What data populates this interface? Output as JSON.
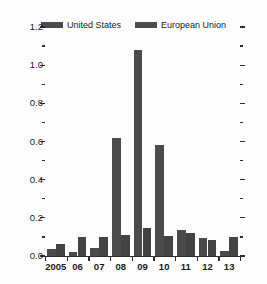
{
  "chart_data": {
    "type": "bar",
    "title": "",
    "subtitle": "",
    "xlabel": "",
    "ylabel": "",
    "ylim": [
      0.0,
      1.2
    ],
    "ytick_values": [
      0.0,
      0.2,
      0.4,
      0.6,
      0.8,
      1.0,
      1.2
    ],
    "ytick_labels": [
      "0.0",
      "0.2",
      "0.4",
      "0.6",
      "0.8",
      "1.0",
      "1.2"
    ],
    "yminor_values": [
      0.1,
      0.3,
      0.5,
      0.7,
      0.9,
      1.1
    ],
    "grid": false,
    "legend_position": "top-center",
    "categories": [
      "2005",
      "06",
      "07",
      "08",
      "09",
      "10",
      "11",
      "12",
      "13"
    ],
    "series": [
      {
        "name": "United States",
        "color": "#4b4b4b",
        "values": [
          0.035,
          0.02,
          0.04,
          0.62,
          1.08,
          0.58,
          0.135,
          0.095,
          0.025
        ]
      },
      {
        "name": "European Union",
        "color": "#434343",
        "values": [
          0.065,
          0.1,
          0.1,
          0.11,
          0.145,
          0.105,
          0.12,
          0.085,
          0.1
        ]
      }
    ]
  },
  "legend": {
    "entries": [
      {
        "label": "United States",
        "color": "#4b4b4b"
      },
      {
        "label": "European Union",
        "color": "#434343"
      }
    ]
  },
  "colors": {
    "bar": "#4b4b4b",
    "axis": "#2d2d2d",
    "text": "#1b1b1b",
    "background": "#fdfdfd"
  }
}
